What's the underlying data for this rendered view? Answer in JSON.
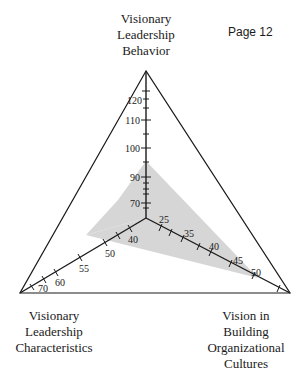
{
  "page_label": "Page 12",
  "axes": {
    "top": {
      "label_lines": [
        "Visionary",
        "Leadership",
        "Behavior"
      ],
      "tick_labels": [
        "70",
        "90",
        "100",
        "110",
        "120"
      ]
    },
    "left": {
      "label_lines": [
        "Visionary",
        "Leadership",
        "Characteristics"
      ],
      "tick_labels": [
        "40",
        "50",
        "55",
        "60",
        "70"
      ]
    },
    "right": {
      "label_lines": [
        "Vision in",
        "Building",
        "Organizational",
        "Cultures"
      ],
      "tick_labels": [
        "25",
        "35",
        "40",
        "45",
        "50"
      ]
    }
  },
  "colors": {
    "line": "#1a1a1a",
    "shade": "#d6d6d6"
  }
}
